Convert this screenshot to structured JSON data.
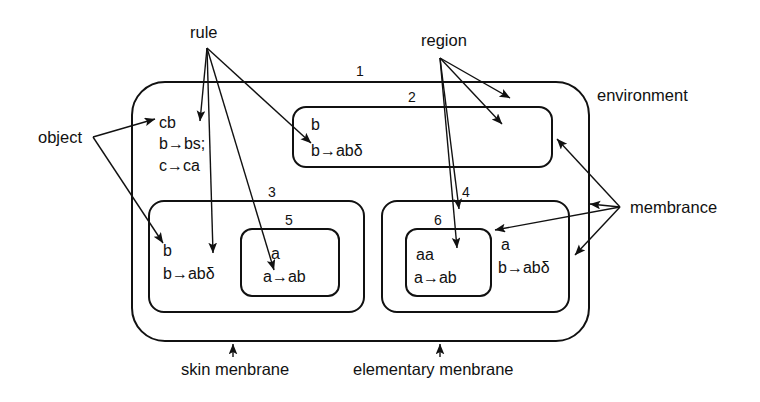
{
  "diagram": {
    "title_caption": "P system membrane structure diagram",
    "annotations": {
      "rule": "rule",
      "region": "region",
      "environment": "environment",
      "object": "object",
      "membrance": "membrance",
      "skin_membrane": "skin menbrane",
      "elementary_membrane": "elementary menbrane"
    },
    "membranes": [
      {
        "id": "1",
        "label": "1",
        "role": "skin-membrane",
        "contents": [
          "cb",
          "b→bs;",
          "c→ca"
        ]
      },
      {
        "id": "2",
        "label": "2",
        "role": "elementary-membrane",
        "contents": [
          "b",
          "b→abδ"
        ]
      },
      {
        "id": "3",
        "label": "3",
        "role": "inner-membrane",
        "contents": [
          "b",
          "b→abδ"
        ]
      },
      {
        "id": "4",
        "label": "4",
        "role": "inner-membrane",
        "contents": [
          "a",
          "b→abδ"
        ]
      },
      {
        "id": "5",
        "label": "5",
        "role": "elementary-membrane",
        "contents": [
          "a",
          "a→ab"
        ]
      },
      {
        "id": "6",
        "label": "6",
        "role": "elementary-membrane",
        "contents": [
          "aa",
          "a→ab"
        ]
      }
    ],
    "colors": {
      "stroke": "#111111",
      "background": "#ffffff",
      "text": "#111111"
    }
  }
}
